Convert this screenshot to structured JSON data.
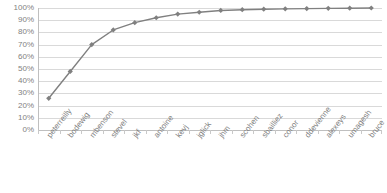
{
  "chart_data": {
    "type": "line",
    "title": "",
    "subtitle": "",
    "xlabel": "",
    "ylabel": "",
    "ylim": [
      0,
      100
    ],
    "grid": true,
    "legend": false,
    "legend_position": "none",
    "marker": "diamond",
    "series_color": "#808080",
    "grid_color": "#d9d9d9",
    "axis_color": "#bfbfbf",
    "text_color": "#7f7f7f",
    "categories": [
      "peterreilly",
      "bodewig",
      "mbenson",
      "stevel",
      "jkf",
      "antoine",
      "kevj",
      "jglick",
      "jhm",
      "scohen",
      "sbailliez",
      "conor",
      "ddevienne",
      "alexeys",
      "umagesh",
      "bruce"
    ],
    "values": [
      26,
      48,
      70,
      82,
      88,
      92,
      95,
      96.5,
      98,
      98.6,
      99,
      99.3,
      99.5,
      99.7,
      99.85,
      100
    ],
    "ytick_labels": [
      "100%",
      "90%",
      "80%",
      "70%",
      "60%",
      "50%",
      "40%",
      "30%",
      "20%",
      "10%",
      "0%"
    ],
    "ytick_values": [
      100,
      90,
      80,
      70,
      60,
      50,
      40,
      30,
      20,
      10,
      0
    ]
  }
}
